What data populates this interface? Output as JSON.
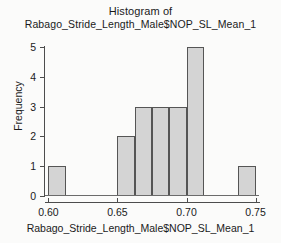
{
  "chart_data": {
    "type": "bar",
    "title": "Histogram of Rabago_Stride_Length_Male$NOP_SL_Mean_1",
    "title_lines": [
      "Histogram of",
      "Rabago_Stride_Length_Male$NOP_SL_Mean_1"
    ],
    "xlabel": "Rabago_Stride_Length_Male$NOP_SL_Mean_1",
    "ylabel": "Frequency",
    "xlim": [
      0.5975,
      0.7525
    ],
    "ylim": [
      0,
      5
    ],
    "grid": false,
    "legend": false,
    "bin_width": 0.0125,
    "x_tick_labels": [
      "0.60",
      "0.65",
      "0.70",
      "0.75"
    ],
    "x_tick_values": [
      0.6,
      0.65,
      0.7,
      0.75
    ],
    "y_tick_labels": [
      "0",
      "1",
      "2",
      "3",
      "4",
      "5"
    ],
    "y_tick_values": [
      0,
      1,
      2,
      3,
      4,
      5
    ],
    "bins": [
      {
        "left": 0.6,
        "right": 0.6125,
        "value": 1
      },
      {
        "left": 0.6125,
        "right": 0.625,
        "value": 0
      },
      {
        "left": 0.625,
        "right": 0.6375,
        "value": 0
      },
      {
        "left": 0.6375,
        "right": 0.65,
        "value": 0
      },
      {
        "left": 0.65,
        "right": 0.6625,
        "value": 2
      },
      {
        "left": 0.6625,
        "right": 0.675,
        "value": 3
      },
      {
        "left": 0.675,
        "right": 0.6875,
        "value": 3
      },
      {
        "left": 0.6875,
        "right": 0.7,
        "value": 3
      },
      {
        "left": 0.7,
        "right": 0.7125,
        "value": 5
      },
      {
        "left": 0.7125,
        "right": 0.725,
        "value": 0
      },
      {
        "left": 0.725,
        "right": 0.7375,
        "value": 0
      },
      {
        "left": 0.7375,
        "right": 0.75,
        "value": 1
      }
    ],
    "colors": {
      "bar_fill": "#d4d4d4",
      "bar_edge": "#555555",
      "axis": "#4d4d4d",
      "text": "#1a1a1a",
      "background": "#fbfbfa"
    }
  }
}
